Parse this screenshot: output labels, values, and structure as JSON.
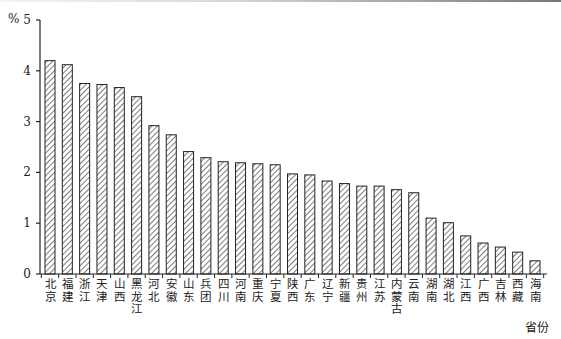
{
  "chart_data": {
    "type": "bar",
    "title": "",
    "ylabel": "%",
    "xlabel": "省份",
    "ylim": [
      0,
      5
    ],
    "yticks": [
      0,
      1,
      2,
      3,
      4,
      5
    ],
    "grid": false,
    "legend": null,
    "bar_style": "diagonal-hatch",
    "categories": [
      "北京",
      "福建",
      "浙江",
      "天津",
      "山西",
      "黑龙江",
      "河北",
      "安徽",
      "山东",
      "兵团",
      "四川",
      "河南",
      "重庆",
      "宁夏",
      "陕西",
      "广东",
      "辽宁",
      "新疆",
      "贵州",
      "江苏",
      "内蒙古",
      "云南",
      "湖南",
      "湖北",
      "江西",
      "广西",
      "吉林",
      "西藏",
      "海南"
    ],
    "values": [
      4.2,
      4.12,
      3.75,
      3.73,
      3.67,
      3.49,
      2.92,
      2.74,
      2.41,
      2.29,
      2.21,
      2.19,
      2.17,
      2.15,
      1.97,
      1.95,
      1.83,
      1.78,
      1.73,
      1.73,
      1.66,
      1.6,
      1.1,
      1.01,
      0.75,
      0.61,
      0.53,
      0.43,
      0.26
    ]
  },
  "labels": {
    "y_unit": "%",
    "x_unit": "省份"
  },
  "colors": {
    "axis": "#222222",
    "bar_stroke": "#222222",
    "hatch": "#333333",
    "background": "#ffffff"
  }
}
